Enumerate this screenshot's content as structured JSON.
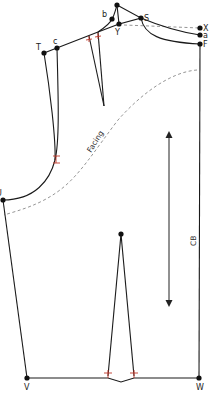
{
  "diagram": {
    "colors": {
      "outline": "#1a1a1a",
      "facing_line": "#7a7a7a",
      "notch_marks": "#c0392b",
      "points": "#111111"
    },
    "points": [
      {
        "id": "top",
        "label": "Z",
        "x": 117,
        "y": 5
      },
      {
        "id": "b",
        "label": "b",
        "x": 112,
        "y": 19
      },
      {
        "id": "Y",
        "label": "Y",
        "x": 119,
        "y": 24
      },
      {
        "id": "S",
        "label": "S",
        "x": 141,
        "y": 18
      },
      {
        "id": "X",
        "label": "X",
        "x": 200,
        "y": 28
      },
      {
        "id": "a",
        "label": "a",
        "x": 200,
        "y": 35
      },
      {
        "id": "F",
        "label": "F",
        "x": 200,
        "y": 44
      },
      {
        "id": "T",
        "label": "T",
        "x": 44,
        "y": 53
      },
      {
        "id": "c",
        "label": "c",
        "x": 57,
        "y": 48
      },
      {
        "id": "U",
        "label": "U",
        "x": 3,
        "y": 200
      },
      {
        "id": "dart_point",
        "label": "",
        "x": 121,
        "y": 234
      },
      {
        "id": "V",
        "label": "V",
        "x": 27,
        "y": 378
      },
      {
        "id": "W",
        "label": "W",
        "x": 199,
        "y": 378
      }
    ],
    "annotations": {
      "facing_label": "Facing",
      "center_back_label": "CB"
    },
    "grainline": {
      "x": 169,
      "y1": 133,
      "y2": 304,
      "direction": "double-arrow"
    }
  }
}
